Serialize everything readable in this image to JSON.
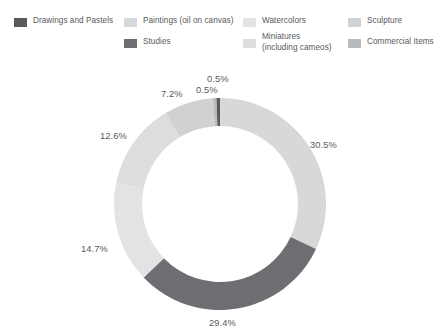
{
  "chart_data": {
    "type": "pie",
    "variant": "donut",
    "title": "",
    "xlabel": "",
    "ylabel": "",
    "legend_position": "top",
    "grid": false,
    "value_unit": "percent",
    "categories": [
      "Drawings and Pastels",
      "Paintings (oil on canvas)",
      "Watercolors",
      "Sculpture",
      "Studies",
      "Miniatures (including cameos)",
      "Commercial Items"
    ],
    "slices": [
      {
        "label": "Paintings (oil on canvas)",
        "value": 30.5,
        "display": "30.5%",
        "color": "#d7d8d9"
      },
      {
        "label": "Studies",
        "value": 29.4,
        "display": "29.4%",
        "color": "#6d6e71"
      },
      {
        "label": "Watercolors",
        "value": 14.7,
        "display": "14.7%",
        "color": "#e2e3e4"
      },
      {
        "label": "Miniatures (including cameos)",
        "value": 12.6,
        "display": "12.6%",
        "color": "#dcdddd"
      },
      {
        "label": "Sculpture",
        "value": 7.2,
        "display": "7.2%",
        "color": "#d0d1d2"
      },
      {
        "label": "Commercial Items",
        "value": 0.5,
        "display": "0.5%",
        "color": "#b9babb"
      },
      {
        "label": "Drawings and Pastels",
        "value": 0.5,
        "display": "0.5%",
        "color": "#58595b"
      }
    ],
    "values": [
      0.5,
      30.5,
      14.7,
      7.2,
      29.4,
      12.6,
      0.5
    ],
    "labels_shown": [
      "0.5%",
      "0.5%",
      "7.2%",
      "12.6%",
      "14.7%",
      "29.4%",
      "30.5%"
    ]
  },
  "legend": {
    "items": [
      {
        "label": "Drawings and Pastels",
        "label2": "",
        "color": "#58595b"
      },
      {
        "label": "Paintings (oil on canvas)",
        "label2": "",
        "color": "#d7d8d9"
      },
      {
        "label": "Watercolors",
        "label2": "",
        "color": "#e2e3e4"
      },
      {
        "label": "Sculpture",
        "label2": "",
        "color": "#d0d1d2"
      },
      {
        "label": "Studies",
        "label2": "",
        "color": "#6d6e71"
      },
      {
        "label": "Miniatures",
        "label2": "(including cameos)",
        "color": "#dcdddd"
      },
      {
        "label": "Commercial Items",
        "label2": "",
        "color": "#b9babb"
      }
    ]
  },
  "labels": {
    "top_a": "0.5%",
    "top_b": "0.5%",
    "upper_left": "7.2%",
    "left_upper": "12.6%",
    "left_lower": "14.7%",
    "bottom": "29.4%",
    "right": "30.5%"
  }
}
